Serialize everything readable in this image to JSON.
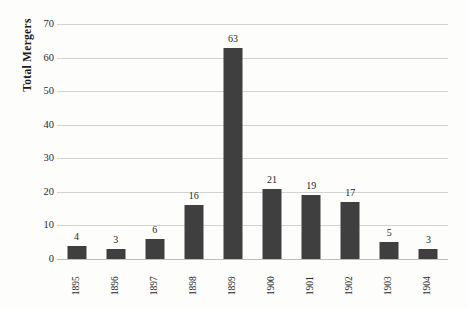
{
  "chart_data": {
    "type": "bar",
    "title": "",
    "subtitle": "",
    "xlabel": "",
    "ylabel": "Total Mergers",
    "categories": [
      "1895",
      "1896",
      "1897",
      "1898",
      "1899",
      "1900",
      "1901",
      "1902",
      "1903",
      "1904"
    ],
    "values": [
      4,
      3,
      6,
      16,
      63,
      21,
      19,
      17,
      5,
      3
    ],
    "data_labels": [
      "4",
      "3",
      "6",
      "16",
      "63",
      "21",
      "19",
      "17",
      "5",
      "3"
    ],
    "ylim": [
      0,
      70
    ],
    "ytick_step": 10,
    "ytick_labels": [
      "70",
      "60",
      "50",
      "40",
      "30",
      "20",
      "10",
      "0"
    ],
    "ytick_values": [
      70,
      60,
      50,
      40,
      30,
      20,
      10,
      0
    ],
    "grid": "horizontal",
    "legend": "none",
    "xtick_rotation": -90,
    "colors": {
      "bar": "#3f3f3f",
      "gridline": "#d3d3d3",
      "axis": "#bdbdbd",
      "background": "#fdfdfc",
      "text": "#1f1f1f"
    }
  }
}
